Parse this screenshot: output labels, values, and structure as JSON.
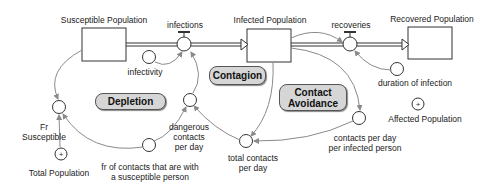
{
  "diagram": {
    "type": "stock-and-flow",
    "stocks": [
      {
        "id": "susceptible",
        "label": "Susceptible Population"
      },
      {
        "id": "infected",
        "label": "Infected Population"
      },
      {
        "id": "recovered",
        "label": "Recovered Population"
      }
    ],
    "flows": [
      {
        "id": "infections",
        "label": "infections",
        "from": "susceptible",
        "to": "infected"
      },
      {
        "id": "recoveries",
        "label": "recoveries",
        "from": "infected",
        "to": "recovered"
      }
    ],
    "auxiliaries": [
      {
        "id": "infectivity",
        "label": "infectivity"
      },
      {
        "id": "dangerous",
        "label_lines": [
          "dangerous",
          "contacts",
          "per day"
        ]
      },
      {
        "id": "fr_contacts",
        "label_lines": [
          "fr of contacts that are with",
          "a susceptible person"
        ]
      },
      {
        "id": "fr_susceptible",
        "label_lines": [
          "Fr",
          "Susceptible"
        ]
      },
      {
        "id": "total_contacts",
        "label_lines": [
          "total contacts",
          "per day"
        ]
      },
      {
        "id": "contacts_per_infected",
        "label_lines": [
          "contacts per day",
          "per infected person"
        ]
      },
      {
        "id": "duration",
        "label": "duration of infection"
      }
    ],
    "summary_variables": [
      {
        "id": "total_population",
        "label": "Total Population",
        "symbol": "+"
      },
      {
        "id": "affected_population",
        "label": "Affected Population",
        "symbol": "+"
      }
    ],
    "loops": [
      {
        "id": "depletion",
        "label": "Depletion"
      },
      {
        "id": "contagion",
        "label": "Contagion"
      },
      {
        "id": "contact_avoidance",
        "label_lines": [
          "Contact",
          "Avoidance"
        ]
      }
    ],
    "colors": {
      "link": "#8a8a8a",
      "stroke": "#333333",
      "loop_fill": "#d6d6d6"
    }
  }
}
